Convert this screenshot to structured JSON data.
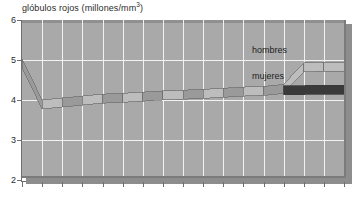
{
  "chart_data": {
    "type": "area",
    "title_main": "glóbulos rojos (millones/mm",
    "title_sup": "3",
    "title_tail": ")",
    "xlabel": "",
    "ylabel": "",
    "ylim": [
      2,
      6
    ],
    "yticks": [
      6,
      5,
      4,
      3,
      2
    ],
    "xtick_count": 16,
    "xtick_labels": [],
    "grid": true,
    "legend_position": "inline-right",
    "style": "3d-ribbon-band",
    "series": [
      {
        "name": "hombres",
        "label": "hombres",
        "color": "#bdbdbd",
        "x": [
          0,
          1,
          2,
          3,
          4,
          5,
          6,
          7,
          8,
          9,
          10,
          11,
          12,
          13,
          14,
          15,
          16
        ],
        "values": [
          5.0,
          3.95,
          4.0,
          4.05,
          4.1,
          4.12,
          4.15,
          4.18,
          4.2,
          4.22,
          4.25,
          4.28,
          4.3,
          4.35,
          4.9,
          4.92,
          4.92
        ]
      },
      {
        "name": "mujeres",
        "label": "mujeres",
        "color": "#3a3a3a",
        "x": [
          0,
          1,
          2,
          3,
          4,
          5,
          6,
          7,
          8,
          9,
          10,
          11,
          12,
          13,
          14,
          15,
          16
        ],
        "values": [
          5.0,
          3.95,
          4.0,
          4.05,
          4.1,
          4.12,
          4.15,
          4.18,
          4.2,
          4.22,
          4.25,
          4.28,
          4.3,
          4.32,
          4.32,
          4.33,
          4.33
        ]
      }
    ],
    "split_x_index": 13
  },
  "colors": {
    "plot_background": "#a9a9a9",
    "gridline": "#f2f2f2",
    "axis": "#6f6f6f",
    "shadow_plate": "#8d8d8d",
    "band_light": "#bdbdbd",
    "band_mid": "#9a9a9a",
    "band_dark": "#3a3a3a",
    "band_edge": "#6e6e6e",
    "text": "#2b2b2b"
  },
  "labels": {
    "hombres": "hombres",
    "mujeres": "mujeres"
  }
}
